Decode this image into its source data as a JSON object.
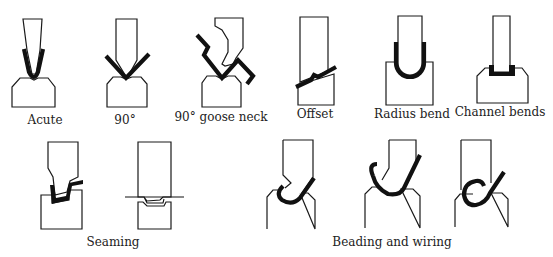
{
  "diagram": {
    "colors": {
      "background": "#ffffff",
      "outline": "#1a1a1a",
      "sheet_metal": "#111111",
      "label_text": "#222222"
    },
    "top_row": [
      {
        "id": "acute",
        "label": "Acute"
      },
      {
        "id": "ninety",
        "label": "90°"
      },
      {
        "id": "goose-neck",
        "label": "90° goose neck"
      },
      {
        "id": "offset",
        "label": "Offset"
      },
      {
        "id": "radius-bend",
        "label": "Radius bend"
      },
      {
        "id": "channel-bends",
        "label": "Channel bends"
      }
    ],
    "bottom_row": [
      {
        "id": "seaming",
        "label": "Seaming",
        "figures": 2
      },
      {
        "id": "beading-wiring",
        "label": "Beading and wiring",
        "figures": 3
      }
    ]
  }
}
